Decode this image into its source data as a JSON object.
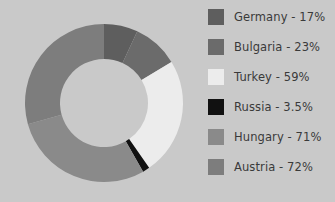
{
  "background_color": "#c9c9c9",
  "text_color": "#3a3a3a",
  "legend": {
    "position": "right",
    "items": [
      {
        "label": "Germany - 17%",
        "name": "Germany",
        "value": 17,
        "color": "#5e5e5e"
      },
      {
        "label": "Bulgaria - 23%",
        "name": "Bulgaria",
        "value": 23,
        "color": "#6b6b6b"
      },
      {
        "label": "Turkey - 59%",
        "name": "Turkey",
        "value": 59,
        "color": "#ececec"
      },
      {
        "label": "Russia - 3.5%",
        "name": "Russia",
        "value": 3.5,
        "color": "#111111"
      },
      {
        "label": "Hungary - 71%",
        "name": "Hungary",
        "value": 71,
        "color": "#8a8a8a"
      },
      {
        "label": "Austria - 72%",
        "name": "Austria",
        "value": 72,
        "color": "#7d7d7d"
      }
    ]
  },
  "chart_data": {
    "type": "pie",
    "variant": "donut",
    "title": "",
    "xlabel": "",
    "ylabel": "",
    "grid": false,
    "legend_position": "right",
    "center_x": 104,
    "center_y": 103,
    "outer_radius": 79,
    "inner_radius": 44,
    "start_angle_deg": 0,
    "direction": "clockwise",
    "categories": [
      "Germany",
      "Bulgaria",
      "Turkey",
      "Russia",
      "Hungary",
      "Austria"
    ],
    "values": [
      17,
      23,
      59,
      3.5,
      71,
      72
    ],
    "value_unit": "%",
    "colors": [
      "#5e5e5e",
      "#6b6b6b",
      "#ececec",
      "#111111",
      "#8a8a8a",
      "#7d7d7d"
    ],
    "slices": [
      {
        "label": "Germany - 17%",
        "name": "Germany",
        "value": 17,
        "color": "#5e5e5e"
      },
      {
        "label": "Bulgaria - 23%",
        "name": "Bulgaria",
        "value": 23,
        "color": "#6b6b6b"
      },
      {
        "label": "Turkey - 59%",
        "name": "Turkey",
        "value": 59,
        "color": "#ececec"
      },
      {
        "label": "Russia - 3.5%",
        "name": "Russia",
        "value": 3.5,
        "color": "#111111"
      },
      {
        "label": "Hungary - 71%",
        "name": "Hungary",
        "value": 71,
        "color": "#8a8a8a"
      },
      {
        "label": "Austria - 72%",
        "name": "Austria",
        "value": 72,
        "color": "#7d7d7d"
      }
    ]
  }
}
